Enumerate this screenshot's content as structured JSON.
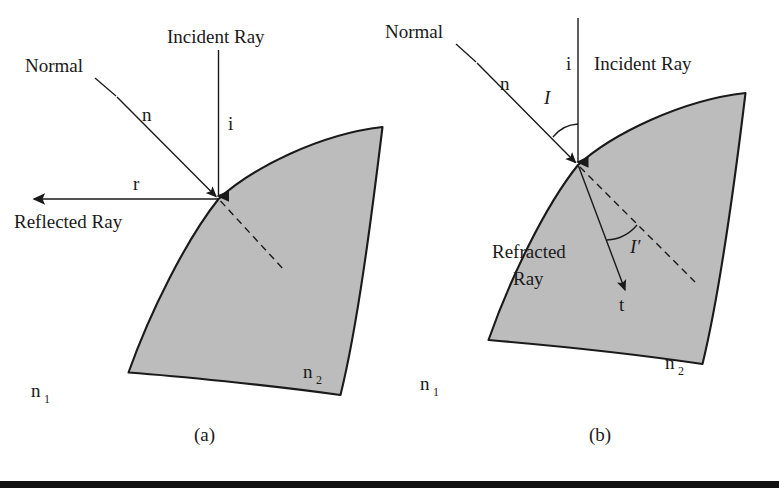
{
  "figure": {
    "background_color": "#ffffff",
    "medium_fill_color": "#bcbcbc",
    "stroke_color": "#1a1a1a",
    "bottom_rule_color": "#111111"
  },
  "panel_a": {
    "caption": "(a)",
    "labels": {
      "incident_ray": "Incident Ray",
      "incident_symbol": "i",
      "normal": "Normal",
      "normal_symbol": "n",
      "reflected_ray": "Reflected Ray",
      "reflected_symbol": "r",
      "medium_outer": "n",
      "medium_outer_sub": "1",
      "medium_inner": "n",
      "medium_inner_sub": "2"
    }
  },
  "panel_b": {
    "caption": "(b)",
    "labels": {
      "normal": "Normal",
      "normal_symbol": "n",
      "incident_ray": "Incident Ray",
      "incident_symbol": "i",
      "angle_incidence": "I",
      "angle_refraction": "I′",
      "refracted_ray_line1": "Refracted",
      "refracted_ray_line2": "Ray",
      "transmitted_symbol": "t",
      "medium_outer": "n",
      "medium_outer_sub": "1",
      "medium_inner": "n",
      "medium_inner_sub": "2"
    }
  }
}
